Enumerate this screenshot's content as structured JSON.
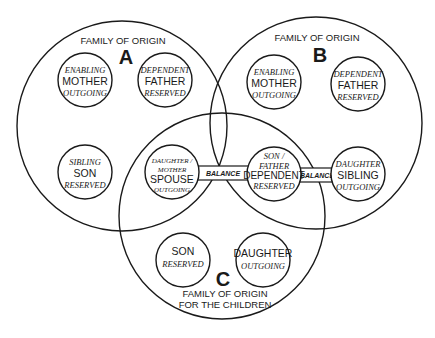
{
  "diagram": {
    "families": {
      "A": {
        "heading": "FAMILY OF ORIGIN",
        "letter": "A",
        "members": [
          {
            "top": "ENABLING",
            "role": "MOTHER",
            "bottom": "OUTGOING"
          },
          {
            "top": "DEPENDENT",
            "role": "FATHER",
            "bottom": "RESERVED"
          },
          {
            "top": "SIBLING",
            "role": "SON",
            "bottom": "RESERVED"
          }
        ]
      },
      "B": {
        "heading": "FAMILY OF ORIGIN",
        "letter": "B",
        "members": [
          {
            "top": "ENABLING",
            "role": "MOTHER",
            "bottom": "OUTGOING"
          },
          {
            "top": "DEPENDENT",
            "role": "FATHER",
            "bottom": "RESERVED"
          },
          {
            "top": "DAUGHTER",
            "role": "SIBLING",
            "bottom": "OUTGOING"
          }
        ]
      },
      "C": {
        "letter": "C",
        "heading_line1": "FAMILY OF ORIGIN",
        "heading_line2": "FOR THE CHILDREN",
        "members": [
          {
            "role": "SON",
            "bottom": "RESERVED"
          },
          {
            "role": "DAUGHTER",
            "bottom": "OUTGOING"
          }
        ]
      }
    },
    "shared": {
      "spouse": {
        "top1": "DAUGHTER /",
        "top2": "MOTHER",
        "role": "SPOUSE",
        "bottom": "OUTGOING"
      },
      "dependent": {
        "top1": "SON /",
        "top2": "FATHER",
        "role": "DEPENDENT",
        "bottom": "RESERVED"
      }
    },
    "links": [
      {
        "label": "BALANCE",
        "from": "spouse",
        "to": "dependent"
      },
      {
        "label": "BALANCE",
        "from": "dependent",
        "to": "sibling-daughter"
      }
    ]
  }
}
